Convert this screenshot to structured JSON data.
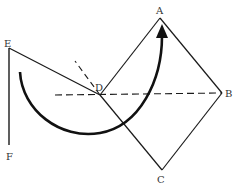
{
  "diagram": {
    "colors": {
      "stroke": "#1a1a1a",
      "label": "#333333",
      "background": "#ffffff"
    },
    "points": {
      "A": {
        "label": "A",
        "x": 160,
        "y": 18
      },
      "B": {
        "label": "B",
        "x": 222,
        "y": 93
      },
      "C": {
        "label": "C",
        "x": 162,
        "y": 170
      },
      "D": {
        "label": "D",
        "x": 100,
        "y": 95
      },
      "E": {
        "label": "E",
        "x": 9,
        "y": 48
      },
      "F": {
        "label": "F",
        "x": 9,
        "y": 145
      }
    },
    "segments": [
      {
        "name": "A-B",
        "style": "solid"
      },
      {
        "name": "B-C",
        "style": "solid"
      },
      {
        "name": "C-D",
        "style": "solid"
      },
      {
        "name": "D-A",
        "style": "solid"
      },
      {
        "name": "E-D",
        "style": "solid"
      },
      {
        "name": "E-F",
        "style": "solid"
      },
      {
        "name": "D-B horizontal",
        "style": "dashed"
      },
      {
        "name": "D upward extension",
        "style": "dashed"
      }
    ],
    "arrow": {
      "description": "curved rotation arrow from near E sweeping below D up toward A",
      "head": "filled-triangle"
    }
  }
}
